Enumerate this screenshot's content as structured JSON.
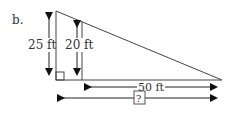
{
  "problem_label": "b.",
  "diagram": {
    "type": "right-triangle-similar-heights",
    "labels": {
      "tall_height": "25 ft",
      "short_height": "20 ft",
      "partial_base": "50 ft",
      "full_base": "?"
    },
    "colors": {
      "stroke": "#333333",
      "arrow": "#111111",
      "background": "#ffffff"
    }
  }
}
